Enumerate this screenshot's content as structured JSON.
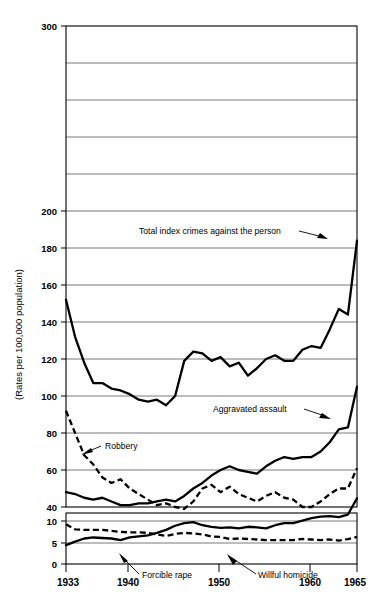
{
  "chart_data": {
    "type": "line",
    "title": "",
    "xlabel": "",
    "ylabel": "(Rates per 100,000 population)",
    "x": [
      1933,
      1934,
      1935,
      1936,
      1937,
      1938,
      1939,
      1940,
      1941,
      1942,
      1943,
      1944,
      1945,
      1946,
      1947,
      1948,
      1949,
      1950,
      1951,
      1952,
      1953,
      1954,
      1955,
      1956,
      1957,
      1958,
      1959,
      1960,
      1961,
      1962,
      1963,
      1964,
      1965
    ],
    "xlim": [
      1933,
      1965
    ],
    "xticks": [
      1933,
      1940,
      1950,
      1960,
      1965
    ],
    "xticklabels": [
      "1933",
      "1940",
      "1950",
      "1960",
      "1965"
    ],
    "grid": true,
    "legend_position": "inline-annotations",
    "panels": [
      {
        "name": "upper-panel",
        "ylim": [
          40,
          300
        ],
        "yticks": [
          40,
          60,
          80,
          100,
          120,
          140,
          160,
          180,
          200,
          220,
          240,
          260,
          280,
          300
        ],
        "yticklabels": [
          "40",
          "60",
          "80",
          "100",
          "120",
          "140",
          "160",
          "180",
          "200",
          "",
          "",
          "",
          "",
          "300"
        ],
        "series": [
          {
            "name": "Total index crimes against the person",
            "style": "solid",
            "values": [
              152,
              132,
              118,
              107,
              107,
              104,
              103,
              101,
              98,
              97,
              98,
              95,
              100,
              119,
              124,
              123,
              119,
              121,
              116,
              118,
              111,
              115,
              120,
              122,
              119,
              119,
              125,
              127,
              126,
              136,
              147,
              144,
              184
            ]
          },
          {
            "name": "Aggravated assault",
            "style": "solid",
            "values": [
              48,
              47,
              45,
              44,
              45,
              43,
              41,
              41,
              42,
              42,
              43,
              44,
              43,
              46,
              50,
              53,
              57,
              60,
              62,
              60,
              59,
              58,
              62,
              65,
              67,
              66,
              67,
              67,
              70,
              75,
              82,
              83,
              105
            ]
          },
          {
            "name": "Robbery",
            "style": "dashed",
            "values": [
              92,
              80,
              68,
              63,
              56,
              53,
              55,
              50,
              47,
              44,
              41,
              42,
              40,
              39,
              43,
              50,
              52,
              48,
              51,
              47,
              45,
              43,
              46,
              48,
              45,
              44,
              40,
              40,
              43,
              47,
              50,
              50,
              61
            ]
          }
        ]
      },
      {
        "name": "lower-panel",
        "ylim": [
          0,
          10
        ],
        "yticks": [
          0,
          5,
          10
        ],
        "yticklabels": [
          "0",
          "5",
          "10"
        ],
        "series": [
          {
            "name": "Forcible rape",
            "style": "solid",
            "values": [
              3.7,
              4.4,
              5.0,
              5.2,
              5.1,
              5.0,
              4.7,
              5.2,
              5.4,
              5.6,
              6.1,
              6.7,
              7.5,
              8.0,
              8.2,
              7.6,
              7.3,
              7.1,
              7.2,
              7.0,
              7.3,
              7.2,
              7.0,
              7.6,
              8.0,
              8.0,
              8.5,
              9.0,
              9.3,
              9.4,
              9.2,
              9.7,
              12.9
            ]
          },
          {
            "name": "Willful homicide",
            "style": "dashed",
            "values": [
              7.8,
              6.8,
              6.7,
              6.7,
              6.7,
              6.5,
              6.3,
              6.2,
              6.2,
              6.1,
              5.8,
              5.5,
              5.9,
              6.1,
              6.0,
              5.8,
              5.4,
              5.3,
              4.9,
              5.0,
              4.9,
              4.8,
              4.7,
              4.7,
              4.7,
              4.7,
              4.9,
              4.8,
              4.7,
              4.8,
              4.6,
              4.9,
              5.3
            ]
          }
        ]
      }
    ],
    "annotations": [
      {
        "text": "Total index crimes against the person",
        "target_series": "Total index crimes against the person"
      },
      {
        "text": "Aggravated assault",
        "target_series": "Aggravated assault"
      },
      {
        "text": "Robbery",
        "target_series": "Robbery"
      },
      {
        "text": "Forcible rape",
        "target_series": "Forcible rape"
      },
      {
        "text": "Willful homicide",
        "target_series": "Willful homicide"
      }
    ]
  },
  "axis": {
    "y_title": "(Rates per 100,000 population)",
    "upper_labels": {
      "l300": "300",
      "l200": "200",
      "l180": "180",
      "l160": "160",
      "l140": "140",
      "l120": "120",
      "l100": "100",
      "l80": "80",
      "l60": "60",
      "l40": "40"
    },
    "lower_labels": {
      "l10": "10",
      "l5": "5",
      "l0": "0"
    },
    "x_labels": {
      "x1933": "1933",
      "x1940": "1940",
      "x1950": "1950",
      "x1960": "1960",
      "x1965": "1965"
    }
  },
  "annotations": {
    "total_index": "Total index crimes against the person",
    "aggravated_assault": "Aggravated assault",
    "robbery": "Robbery",
    "forcible_rape": "Forcible rape",
    "willful_homicide": "Willful homicide"
  },
  "colors": {
    "ink": "#000000",
    "grid": "#555555",
    "background": "#ffffff"
  }
}
